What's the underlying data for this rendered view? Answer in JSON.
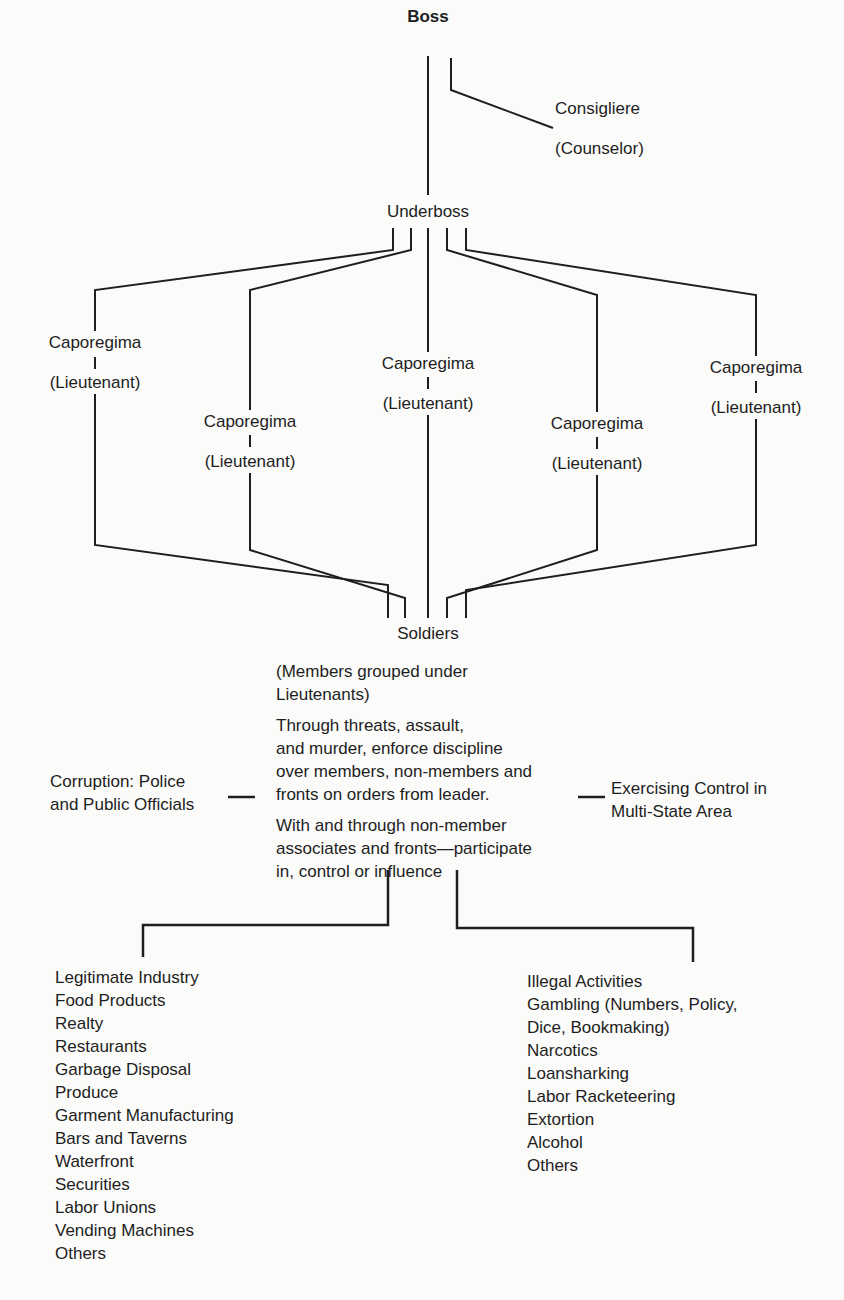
{
  "diagram": {
    "top": {
      "boss": "Boss",
      "consigliere": "Consigliere",
      "consigliere_sub": "(Counselor)",
      "underboss": "Underboss"
    },
    "caporegimes": [
      {
        "title": "Caporegima",
        "sub": "(Lieutenant)"
      },
      {
        "title": "Caporegima",
        "sub": "(Lieutenant)"
      },
      {
        "title": "Caporegima",
        "sub": "(Lieutenant)"
      },
      {
        "title": "Caporegima",
        "sub": "(Lieutenant)"
      },
      {
        "title": "Caporegima",
        "sub": "(Lieutenant)"
      }
    ],
    "soldiers": {
      "label": "Soldiers",
      "note_1": "(Members grouped under Lieutenants)",
      "note_2_lines": [
        "Through threats, assault,",
        "and murder, enforce discipline",
        "over members, non-members and",
        "fronts on orders from leader."
      ],
      "note_3_lines": [
        "With and through non-member",
        "associates and fronts—participate",
        "in, control or influence"
      ]
    },
    "side_left": [
      "Corruption: Police",
      "and Public Officials"
    ],
    "side_right": [
      "Exercising Control in",
      "Multi-State Area"
    ],
    "legitimate": {
      "heading": "Legitimate Industry",
      "items": [
        "Food Products",
        "Realty",
        "Restaurants",
        "Garbage Disposal",
        "Produce",
        "Garment Manufacturing",
        "Bars and Taverns",
        "Waterfront",
        "Securities",
        "Labor Unions",
        "Vending Machines",
        "Others"
      ]
    },
    "illegal": {
      "heading": "Illegal Activities",
      "items": [
        "Gambling (Numbers, Policy,",
        "Dice, Bookmaking)",
        "Narcotics",
        "Loansharking",
        "Labor Racketeering",
        "Extortion",
        "Alcohol",
        "Others"
      ]
    }
  }
}
